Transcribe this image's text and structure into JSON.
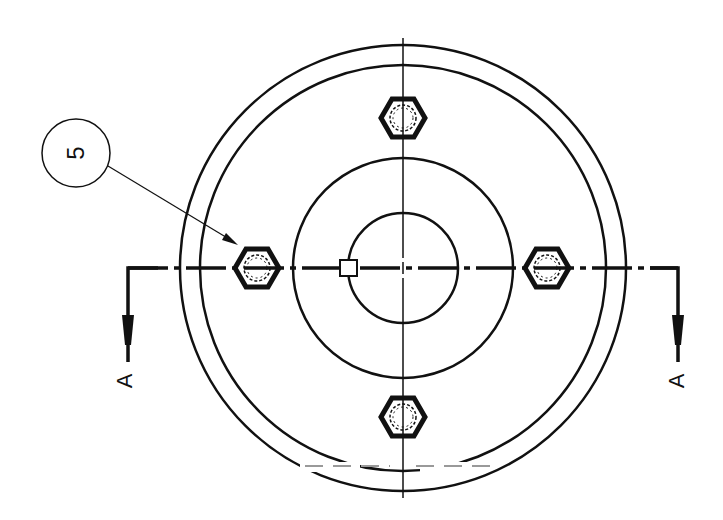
{
  "drawing": {
    "type": "technical-drawing-front-view",
    "line_color": "#111111",
    "background": "#ffffff",
    "balloon": {
      "label": "5",
      "target": "bolt-left"
    },
    "section": {
      "left_label": "A",
      "right_label": "A"
    },
    "circles": [
      {
        "name": "outer-rim",
        "r": 223
      },
      {
        "name": "inner-rim",
        "r": 203
      },
      {
        "name": "hub",
        "r": 110
      },
      {
        "name": "bore",
        "r": 55
      }
    ],
    "bolts": [
      {
        "name": "bolt-top",
        "x": 403,
        "y": 118
      },
      {
        "name": "bolt-left",
        "x": 257,
        "y": 268
      },
      {
        "name": "bolt-right",
        "x": 547,
        "y": 268
      },
      {
        "name": "bolt-bottom",
        "x": 403,
        "y": 417
      }
    ]
  }
}
